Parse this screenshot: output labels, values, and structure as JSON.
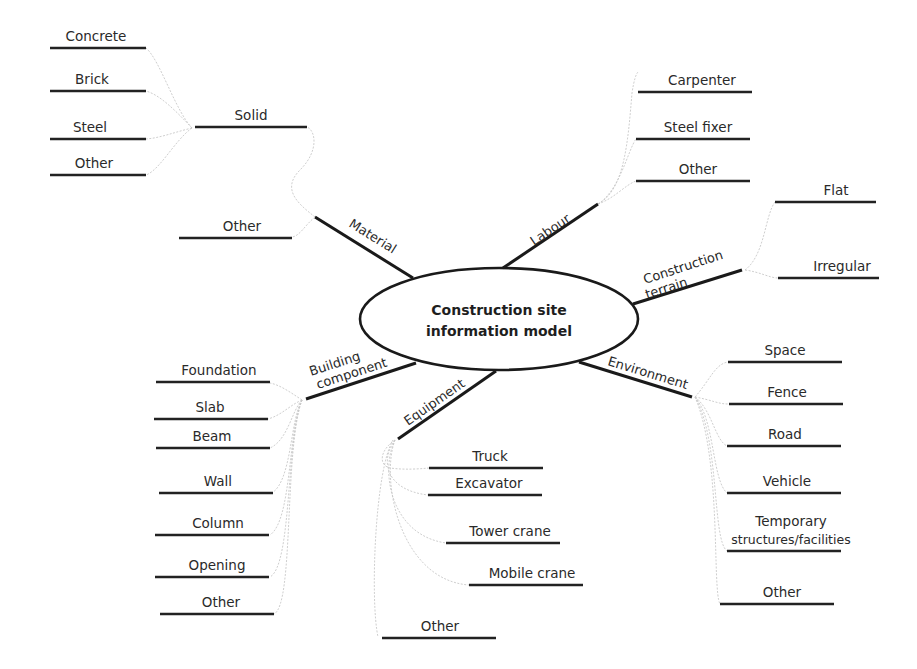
{
  "title": "Construction site information model",
  "center": {
    "line1": "Construction site",
    "line2": "information model"
  },
  "branches": {
    "material": {
      "label": "Material",
      "solid": {
        "label": "Solid",
        "children": [
          "Concrete",
          "Brick",
          "Steel",
          "Other"
        ]
      },
      "other": "Other"
    },
    "labour": {
      "label": "Labour",
      "children": [
        "Carpenter",
        "Steel fixer",
        "Other"
      ]
    },
    "terrain": {
      "line1": "Construction",
      "line2": "terrain",
      "children": [
        "Flat",
        "Irregular"
      ]
    },
    "environment": {
      "label": "Environment",
      "children": [
        "Space",
        "Fence",
        "Road",
        "Vehicle",
        "Temporary",
        "structures/facilities",
        "Other"
      ]
    },
    "equipment": {
      "label": "Equipment",
      "children": [
        "Truck",
        "Excavator",
        "Tower crane",
        "Mobile crane",
        "Other"
      ]
    },
    "building": {
      "line1": "Building",
      "line2": "component",
      "children": [
        "Foundation",
        "Slab",
        "Beam",
        "Wall",
        "Column",
        "Opening",
        "Other"
      ]
    }
  },
  "colors": {
    "line": "#222222",
    "connector": "#c8c8c8",
    "text": "#2a2a2a"
  }
}
